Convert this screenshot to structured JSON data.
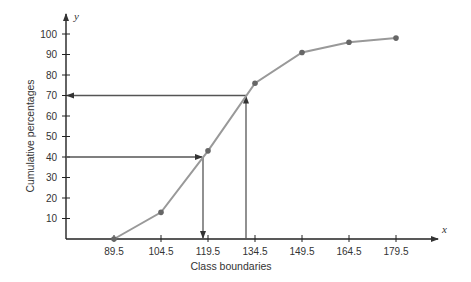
{
  "chart_data": {
    "type": "line",
    "title": "",
    "xlabel": "Class boundaries",
    "ylabel": "Cumulative percentages",
    "x_axis_var": "x",
    "y_axis_var": "y",
    "x": [
      89.5,
      104.5,
      119.5,
      134.5,
      149.5,
      164.5,
      179.5
    ],
    "values": [
      0,
      13,
      43,
      76,
      91,
      96,
      98
    ],
    "x_ticks": [
      "89.5",
      "104.5",
      "119.5",
      "134.5",
      "149.5",
      "164.5",
      "179.5"
    ],
    "y_ticks": [
      "10",
      "20",
      "30",
      "40",
      "50",
      "60",
      "70",
      "80",
      "90",
      "100"
    ],
    "ylim": [
      0,
      100
    ],
    "grid": false,
    "legend": null,
    "annotations": [
      {
        "type": "arrow-path",
        "from_y": 40,
        "to_x": 118,
        "description": "Horizontal arrow from y=40 to curve, then vertical arrow down to x-axis (~118)"
      },
      {
        "type": "arrow-path",
        "from_x": 130,
        "to_y": 70,
        "description": "Vertical line up from x≈130 to curve at 70, then horizontal arrow left to y-axis"
      }
    ],
    "colors": {
      "line": "#999999",
      "points": "#666666",
      "axes": "#222222",
      "arrows": "#555555"
    }
  }
}
